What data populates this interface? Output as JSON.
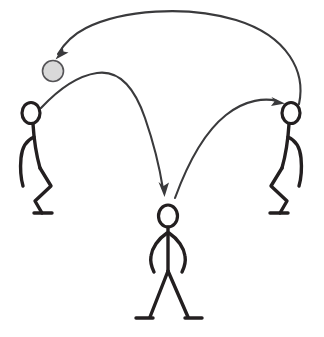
{
  "scene": {
    "title": "Ball passing sequence between three stick figures",
    "width": 324,
    "height": 337,
    "background_color": "#ffffff",
    "figure_stroke_color": "#231f20",
    "arrow_stroke_color": "#3a3a3c",
    "ball_fill_color": "#d9d9d9",
    "ball_outline_color": "#555457"
  },
  "figures": [
    {
      "id": "left",
      "label": "Left stick figure",
      "pose": "crouching, leaning forward, facing right",
      "head_center_x": 31,
      "head_center_y": 113,
      "head_radius_x": 9,
      "head_radius_y": 10.5
    },
    {
      "id": "center",
      "label": "Center stick figure",
      "pose": "standing upright, arms bent, legs apart, facing viewer",
      "head_center_x": 168,
      "head_center_y": 216,
      "head_radius_x": 9.5,
      "head_radius_y": 11
    },
    {
      "id": "right",
      "label": "Right stick figure",
      "pose": "crouching, leaning forward, facing left",
      "head_center_x": 291,
      "head_center_y": 113,
      "head_radius_x": 9,
      "head_radius_y": 10.5
    }
  ],
  "ball": {
    "label": "Gray ball",
    "center_x": 53,
    "center_y": 71,
    "radius": 10.5,
    "fill": "#d9d9d9"
  },
  "arrows": [
    {
      "id": "arc-right-to-ball",
      "label": "Long arc from right figure to ball",
      "from": "right-figure-head",
      "to": "ball",
      "arrowhead_at": "ball"
    },
    {
      "id": "arc-left-to-center",
      "label": "Arc from left figure to center figure",
      "from": "left-figure-head",
      "to": "center-figure-head",
      "arrowhead_at": "center-figure-head"
    },
    {
      "id": "arc-center-to-right",
      "label": "Arc from center figure to right figure",
      "from": "center-figure-head",
      "to": "right-figure-head",
      "arrowhead_at": "right-figure-head"
    }
  ]
}
